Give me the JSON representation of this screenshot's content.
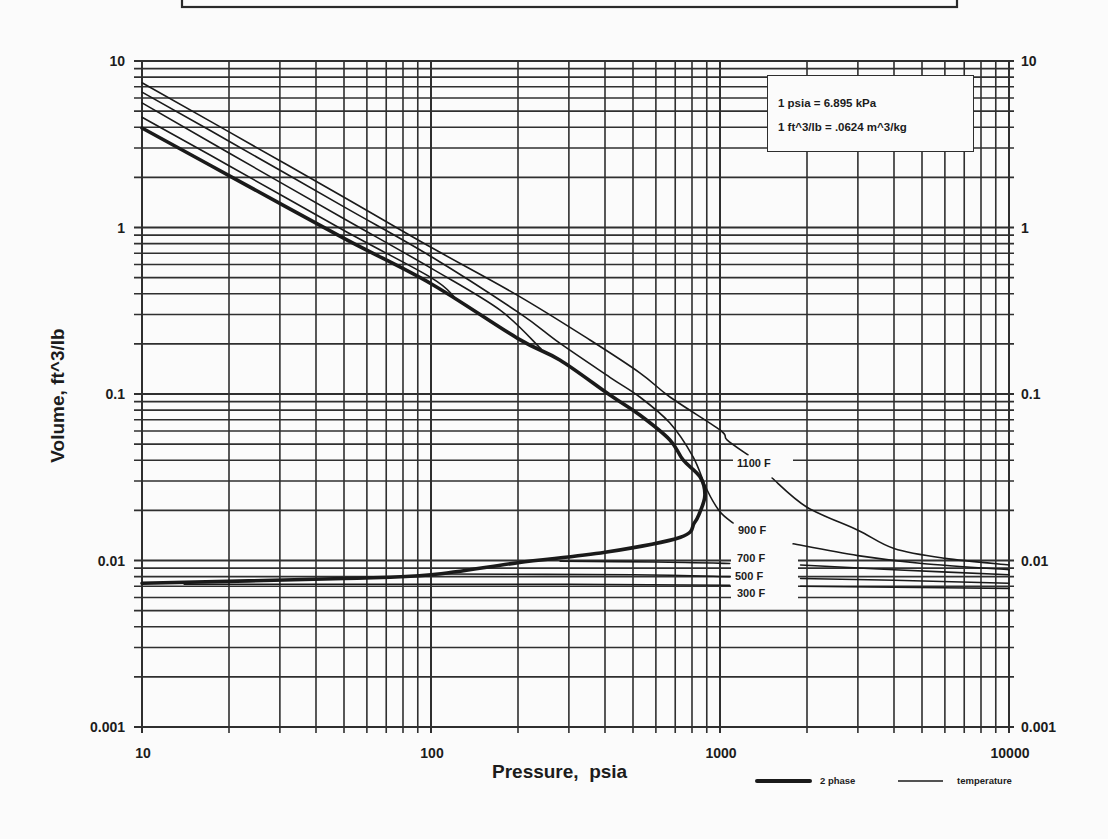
{
  "chart_data": {
    "type": "line",
    "title": "",
    "xlabel": "Pressure,  psia",
    "ylabel": "Volume, ft^3/lb",
    "xscale": "log",
    "yscale": "log",
    "xlim": [
      10,
      10000
    ],
    "ylim": [
      0.001,
      10
    ],
    "x_ticks": [
      "10",
      "100",
      "1000",
      "10000"
    ],
    "y_ticks": [
      "10",
      "1",
      "0.1",
      "0.01",
      "0.001"
    ],
    "y_ticks_right": [
      "10",
      "1",
      "0.1",
      "0.01",
      "0.001"
    ],
    "grid": true,
    "legend_position": "bottom-right, below plot",
    "legend": [
      {
        "label": "2 phase",
        "style": "thick"
      },
      {
        "label": "temperature",
        "style": "thin"
      }
    ],
    "annotations": [
      "1 psia = 6.895 kPa",
      "1 ft^3/lb = .0624 m^3/kg"
    ],
    "series": [
      {
        "name": "2 phase",
        "style": "thick",
        "label": "",
        "segments": [
          [
            [
              10,
              3.96
            ],
            [
              20,
              2.05
            ],
            [
              50,
              0.86
            ],
            [
              100,
              0.46
            ],
            [
              200,
              0.215
            ],
            [
              279,
              0.16
            ],
            [
              416,
              0.0986
            ],
            [
              528,
              0.0748
            ],
            [
              671,
              0.053
            ],
            [
              745,
              0.0402
            ],
            [
              853,
              0.0318
            ],
            [
              887,
              0.0247
            ],
            [
              850,
              0.0193
            ],
            [
              815,
              0.0168
            ],
            [
              730,
              0.0138
            ],
            [
              400,
              0.0112
            ],
            [
              200,
              0.0097
            ],
            [
              100,
              0.0082
            ],
            [
              50,
              0.0078
            ],
            [
              10,
              0.0073
            ]
          ]
        ]
      },
      {
        "name": "1100 F",
        "style": "thin",
        "label": "1100 F",
        "segments": [
          [
            [
              10,
              7.4
            ],
            [
              20,
              3.75
            ],
            [
              50,
              1.52
            ],
            [
              100,
              0.76
            ],
            [
              200,
              0.39
            ],
            [
              355,
              0.211
            ],
            [
              528,
              0.134
            ],
            [
              671,
              0.0959
            ],
            [
              1000,
              0.0608
            ],
            [
              1057,
              0.053
            ],
            [
              1250,
              0.043
            ]
          ],
          [
            [
              1514,
              0.0313
            ],
            [
              2000,
              0.0209
            ],
            [
              3000,
              0.0152
            ],
            [
              4000,
              0.0118
            ],
            [
              6000,
              0.0103
            ],
            [
              10000,
              0.0094
            ]
          ]
        ]
      },
      {
        "name": "900 F",
        "style": "thin",
        "label": "900 F",
        "segments": [
          [
            [
              10,
              6.5
            ],
            [
              20,
              3.3
            ],
            [
              50,
              1.33
            ],
            [
              100,
              0.67
            ],
            [
              200,
              0.31
            ],
            [
              279,
              0.202
            ],
            [
              416,
              0.126
            ],
            [
              528,
              0.0959
            ],
            [
              671,
              0.067
            ],
            [
              807,
              0.0419
            ],
            [
              902,
              0.0265
            ],
            [
              1000,
              0.0196
            ],
            [
              1110,
              0.0168
            ]
          ],
          [
            [
              1791,
              0.0126
            ],
            [
              3000,
              0.0107
            ],
            [
              5000,
              0.0096
            ],
            [
              10000,
              0.0088
            ]
          ]
        ]
      },
      {
        "name": "700 F",
        "style": "thin",
        "label": "700 F",
        "segments": [
          [
            [
              10,
              5.6
            ],
            [
              20,
              2.8
            ],
            [
              50,
              1.13
            ],
            [
              100,
              0.57
            ],
            [
              173,
              0.32
            ],
            [
              240,
              0.187
            ]
          ],
          [
            [
              280,
              0.0099
            ],
            [
              600,
              0.0098
            ],
            [
              1080,
              0.0096
            ]
          ],
          [
            [
              1900,
              0.0094
            ],
            [
              4000,
              0.0088
            ],
            [
              10000,
              0.0082
            ]
          ]
        ]
      },
      {
        "name": "500 F",
        "style": "thin",
        "label": "500 F",
        "segments": [
          [
            [
              10,
              4.6
            ],
            [
              20,
              2.35
            ],
            [
              50,
              0.96
            ],
            [
              100,
              0.5
            ],
            [
              120,
              0.385
            ]
          ],
          [
            [
              110,
              0.0083
            ],
            [
              500,
              0.0082
            ],
            [
              1080,
              0.008
            ]
          ],
          [
            [
              1900,
              0.0078
            ],
            [
              4000,
              0.0076
            ],
            [
              10000,
              0.0073
            ]
          ]
        ]
      },
      {
        "name": "300 F",
        "style": "thin",
        "label": "300 F",
        "segments": [
          [
            [
              14,
              0.0072
            ],
            [
              300,
              0.0072
            ],
            [
              1080,
              0.0071
            ]
          ],
          [
            [
              1900,
              0.007
            ],
            [
              4000,
              0.0069
            ],
            [
              10000,
              0.0068
            ]
          ]
        ]
      }
    ]
  }
}
